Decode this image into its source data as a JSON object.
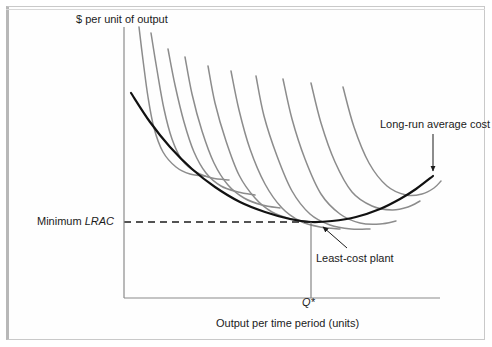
{
  "figure": {
    "kind": "economics-cost-curve-diagram",
    "background": "#ffffff",
    "border_color": "#c9c9c9"
  },
  "axes": {
    "y_axis_title": "$ per unit of output",
    "x_axis_title": "Output per time period (units)",
    "y_tick_labels": [
      "Minimum LRAC"
    ],
    "x_tick_labels": [
      "Q*"
    ],
    "y_tick_label_plain": "Minimum ",
    "y_tick_label_italic": "LRAC",
    "x_tick_label_italic": "Q*",
    "axis_color": "#8a8a8a",
    "origin_px": [
      124,
      298
    ],
    "y_axis_top_px": [
      124,
      27
    ],
    "x_axis_right_px": [
      440,
      298
    ]
  },
  "annotations": [
    {
      "name": "long-run-average-cost",
      "text": "Long-run average cost",
      "arrow_from": [
        433,
        134
      ],
      "arrow_to": [
        433,
        172
      ]
    },
    {
      "name": "least-cost-plant",
      "text": "Least-cost plant",
      "arrow_from": [
        347,
        248
      ],
      "arrow_to": [
        322,
        226
      ]
    }
  ],
  "guides": {
    "minimum_lrac_dashed_y": 222,
    "q_star_vertical_x": 311,
    "dash_color": "#1b1b1b"
  },
  "chart_data": {
    "type": "line",
    "title": "",
    "subtitle": "",
    "xlabel": "Output per time period (units)",
    "ylabel": "$ per unit of output",
    "grid": false,
    "legend": "none",
    "xlim": [
      0,
      1
    ],
    "ylim": [
      0,
      1
    ],
    "annotations": [
      "Long-run average cost",
      "Least-cost plant",
      "Minimum LRAC",
      "Q*"
    ],
    "series": [
      {
        "name": "Long-run average cost (LRAC) envelope",
        "role": "envelope",
        "color": "#111111",
        "width": 2.2,
        "points": [
          [
            131,
            93
          ],
          [
            150,
            122
          ],
          [
            170,
            147
          ],
          [
            192,
            169
          ],
          [
            215,
            187
          ],
          [
            240,
            202
          ],
          [
            265,
            212
          ],
          [
            290,
            219
          ],
          [
            311,
            222
          ],
          [
            332,
            221
          ],
          [
            356,
            217
          ],
          [
            380,
            209
          ],
          [
            400,
            199
          ],
          [
            416,
            189
          ],
          [
            433,
            176
          ]
        ],
        "minimum_point": [
          311,
          222
        ]
      },
      {
        "name": "SRAC 1",
        "role": "short-run-average-cost",
        "color": "#8c8c8c",
        "tangent_point": [
          152,
          126
        ],
        "points": [
          [
            139,
            27
          ],
          [
            143,
            60
          ],
          [
            148,
            97
          ],
          [
            154,
            128
          ],
          [
            163,
            152
          ],
          [
            176,
            167
          ],
          [
            190,
            174
          ],
          [
            205,
            176
          ]
        ]
      },
      {
        "name": "SRAC 2",
        "role": "short-run-average-cost",
        "color": "#8c8c8c",
        "tangent_point": [
          178,
          157
        ],
        "points": [
          [
            151,
            33
          ],
          [
            157,
            70
          ],
          [
            164,
            109
          ],
          [
            172,
            139
          ],
          [
            182,
            160
          ],
          [
            196,
            172
          ],
          [
            212,
            178
          ],
          [
            229,
            180
          ]
        ]
      },
      {
        "name": "SRAC 3",
        "role": "short-run-average-cost",
        "color": "#8c8c8c",
        "tangent_point": [
          203,
          181
        ],
        "points": [
          [
            168,
            49
          ],
          [
            175,
            85
          ],
          [
            184,
            122
          ],
          [
            194,
            152
          ],
          [
            206,
            173
          ],
          [
            221,
            186
          ],
          [
            238,
            192
          ],
          [
            255,
            195
          ]
        ]
      },
      {
        "name": "SRAC 4",
        "role": "short-run-average-cost",
        "color": "#8c8c8c",
        "tangent_point": [
          228,
          197
        ],
        "points": [
          [
            185,
            57
          ],
          [
            192,
            94
          ],
          [
            202,
            131
          ],
          [
            214,
            163
          ],
          [
            228,
            185
          ],
          [
            244,
            198
          ],
          [
            262,
            205
          ],
          [
            280,
            208
          ]
        ]
      },
      {
        "name": "SRAC 5",
        "role": "short-run-average-cost",
        "color": "#8c8c8c",
        "tangent_point": [
          256,
          210
        ],
        "points": [
          [
            208,
            66
          ],
          [
            215,
            103
          ],
          [
            226,
            141
          ],
          [
            239,
            175
          ],
          [
            255,
            198
          ],
          [
            272,
            212
          ],
          [
            291,
            219
          ],
          [
            310,
            222
          ]
        ]
      },
      {
        "name": "SRAC 6",
        "role": "short-run-average-cost",
        "color": "#8c8c8c",
        "tangent_point": [
          285,
          219
        ],
        "points": [
          [
            231,
            71
          ],
          [
            239,
            110
          ],
          [
            250,
            149
          ],
          [
            265,
            184
          ],
          [
            282,
            208
          ],
          [
            300,
            221
          ],
          [
            320,
            227
          ],
          [
            340,
            229
          ]
        ]
      },
      {
        "name": "SRAC 7",
        "role": "short-run-average-cost",
        "color": "#8c8c8c",
        "tangent_point": [
          313,
          222
        ],
        "points": [
          [
            256,
            76
          ],
          [
            264,
            116
          ],
          [
            277,
            156
          ],
          [
            292,
            191
          ],
          [
            310,
            214
          ],
          [
            330,
            225
          ],
          [
            351,
            229
          ],
          [
            370,
            229
          ]
        ]
      },
      {
        "name": "SRAC 8",
        "role": "short-run-average-cost",
        "color": "#8c8c8c",
        "tangent_point": [
          345,
          219
        ],
        "points": [
          [
            283,
            79
          ],
          [
            292,
            119
          ],
          [
            305,
            159
          ],
          [
            321,
            194
          ],
          [
            340,
            214
          ],
          [
            360,
            223
          ],
          [
            380,
            224
          ],
          [
            396,
            221
          ]
        ]
      },
      {
        "name": "SRAC 9",
        "role": "short-run-average-cost",
        "color": "#8c8c8c",
        "tangent_point": [
          381,
          208
        ],
        "points": [
          [
            311,
            83
          ],
          [
            321,
            123
          ],
          [
            335,
            162
          ],
          [
            352,
            192
          ],
          [
            372,
            206
          ],
          [
            392,
            210
          ],
          [
            408,
            207
          ],
          [
            420,
            201
          ]
        ]
      },
      {
        "name": "SRAC 10",
        "role": "short-run-average-cost",
        "color": "#8c8c8c",
        "tangent_point": [
          408,
          193
        ],
        "points": [
          [
            343,
            87
          ],
          [
            354,
            127
          ],
          [
            369,
            163
          ],
          [
            387,
            186
          ],
          [
            406,
            195
          ],
          [
            422,
            194
          ],
          [
            434,
            188
          ],
          [
            441,
            181
          ]
        ]
      }
    ]
  }
}
